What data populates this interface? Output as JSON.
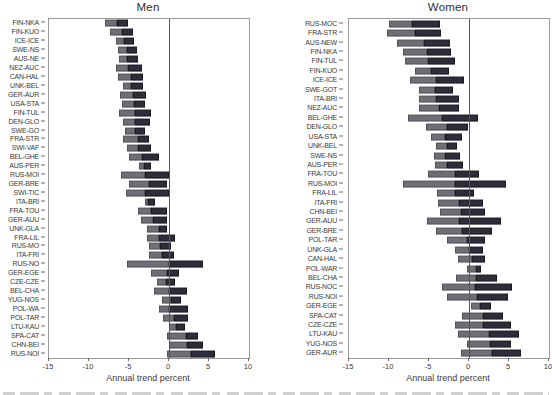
{
  "figure": {
    "kind": "two-panel horizontal stacked bar chart",
    "colors": {
      "gray_segment": "#6e6e74",
      "dark_segment": "#2e2e3a",
      "zero_line": "#55555a",
      "frame": "#9b9b9b",
      "text": "#3b3b3b"
    }
  },
  "chart_data": [
    {
      "type": "bar",
      "orientation": "horizontal",
      "title": "Men",
      "xlabel": "Annual trend percent",
      "xlim": [
        -15,
        10
      ],
      "xticks": [
        -15,
        -10,
        -5,
        0,
        5,
        10
      ],
      "grid": false,
      "legend": false,
      "zero_reference_line": 0,
      "segment_colors": {
        "gray": "#6e6e74",
        "dark": "#2e2e3a"
      },
      "rows": [
        {
          "label": "FIN-NKA",
          "gray": [
            -8.0,
            -6.5
          ],
          "dark": [
            -6.5,
            -5.1
          ]
        },
        {
          "label": "FIN-KUO",
          "gray": [
            -7.4,
            -5.9
          ],
          "dark": [
            -5.9,
            -4.5
          ]
        },
        {
          "label": "ICE-ICE",
          "gray": [
            -6.6,
            -5.6
          ],
          "dark": [
            -5.6,
            -4.4
          ]
        },
        {
          "label": "SWE-NS",
          "gray": [
            -6.4,
            -5.2
          ],
          "dark": [
            -5.2,
            -4.0
          ]
        },
        {
          "label": "AUS-NE",
          "gray": [
            -6.3,
            -5.2
          ],
          "dark": [
            -5.2,
            -3.9
          ]
        },
        {
          "label": "NEZ-AUC",
          "gray": [
            -6.6,
            -5.1
          ],
          "dark": [
            -5.1,
            -3.4
          ]
        },
        {
          "label": "CAN-HAL",
          "gray": [
            -6.4,
            -4.8
          ],
          "dark": [
            -4.8,
            -3.2
          ]
        },
        {
          "label": "UNK-BEL",
          "gray": [
            -5.7,
            -4.7
          ],
          "dark": [
            -4.7,
            -3.3
          ]
        },
        {
          "label": "GER-AUR",
          "gray": [
            -6.1,
            -4.5
          ],
          "dark": [
            -4.5,
            -2.9
          ]
        },
        {
          "label": "USA-STA",
          "gray": [
            -5.9,
            -4.4
          ],
          "dark": [
            -4.4,
            -3.0
          ]
        },
        {
          "label": "FIN-TUL",
          "gray": [
            -6.2,
            -4.3
          ],
          "dark": [
            -4.3,
            -2.2
          ]
        },
        {
          "label": "DEN-GLO",
          "gray": [
            -5.8,
            -4.2
          ],
          "dark": [
            -4.2,
            -2.4
          ]
        },
        {
          "label": "SWE-GO",
          "gray": [
            -5.5,
            -4.2
          ],
          "dark": [
            -4.2,
            -3.0
          ]
        },
        {
          "label": "FRA-STR",
          "gray": [
            -5.8,
            -3.9
          ],
          "dark": [
            -3.9,
            -2.5
          ]
        },
        {
          "label": "SWI-VAF",
          "gray": [
            -5.2,
            -3.9
          ],
          "dark": [
            -3.9,
            -2.3
          ]
        },
        {
          "label": "BEL-GHE",
          "gray": [
            -5.0,
            -3.4
          ],
          "dark": [
            -3.4,
            -1.2
          ]
        },
        {
          "label": "AUS-PER",
          "gray": [
            -3.7,
            -3.1
          ],
          "dark": [
            -3.1,
            -2.3
          ]
        },
        {
          "label": "RUS-MOI",
          "gray": [
            -6.0,
            -3.0
          ],
          "dark": [
            -3.0,
            0.0
          ]
        },
        {
          "label": "GER-BRE",
          "gray": [
            -5.0,
            -2.5
          ],
          "dark": [
            -2.5,
            -0.3
          ]
        },
        {
          "label": "SWI-TIC",
          "gray": [
            -5.4,
            -3.0
          ],
          "dark": [
            -3.0,
            0.0
          ]
        },
        {
          "label": "ITA-BRI",
          "gray": [
            -3.0,
            -2.6
          ],
          "dark": [
            -2.6,
            -1.7
          ]
        },
        {
          "label": "FRA-TOU",
          "gray": [
            -3.9,
            -2.3
          ],
          "dark": [
            -2.3,
            -0.3
          ]
        },
        {
          "label": "GER-AUU",
          "gray": [
            -3.5,
            -2.0
          ],
          "dark": [
            -2.0,
            -0.2
          ]
        },
        {
          "label": "UNK-GLA",
          "gray": [
            -2.7,
            -1.2
          ],
          "dark": [
            -1.2,
            -0.2
          ]
        },
        {
          "label": "FRA-LIL",
          "gray": [
            -2.8,
            -1.3
          ],
          "dark": [
            -1.3,
            0.8
          ]
        },
        {
          "label": "RUS-MO",
          "gray": [
            -2.5,
            -1.1
          ],
          "dark": [
            -1.1,
            0.3
          ]
        },
        {
          "label": "ITA-FRI",
          "gray": [
            -2.5,
            -0.9
          ],
          "dark": [
            -0.9,
            0.6
          ]
        },
        {
          "label": "RUS-NO",
          "gray": [
            -5.3,
            0.0
          ],
          "dark": [
            0.0,
            4.2
          ]
        },
        {
          "label": "GER-EGE",
          "gray": [
            -2.3,
            -0.3
          ],
          "dark": [
            -0.3,
            1.3
          ]
        },
        {
          "label": "CZE-CZE",
          "gray": [
            -1.5,
            -0.4
          ],
          "dark": [
            -0.4,
            0.8
          ]
        },
        {
          "label": "BEL-CHA",
          "gray": [
            -1.9,
            0.0
          ],
          "dark": [
            0.0,
            2.3
          ]
        },
        {
          "label": "YUG-NOS",
          "gray": [
            -0.9,
            0.3
          ],
          "dark": [
            0.3,
            1.5
          ]
        },
        {
          "label": "POL-WA",
          "gray": [
            -1.3,
            0.0
          ],
          "dark": [
            0.0,
            2.4
          ]
        },
        {
          "label": "POL-TAR",
          "gray": [
            -0.7,
            0.6
          ],
          "dark": [
            0.6,
            2.4
          ]
        },
        {
          "label": "LTU-KAU",
          "gray": [
            0.0,
            0.9
          ],
          "dark": [
            0.9,
            2.0
          ]
        },
        {
          "label": "SPA-CAT",
          "gray": [
            -0.2,
            2.1
          ],
          "dark": [
            2.1,
            3.6
          ]
        },
        {
          "label": "CHN-BEI",
          "gray": [
            0.0,
            2.3
          ],
          "dark": [
            2.3,
            4.2
          ]
        },
        {
          "label": "RUS-NOI",
          "gray": [
            -0.2,
            2.8
          ],
          "dark": [
            2.8,
            5.8
          ]
        }
      ]
    },
    {
      "type": "bar",
      "orientation": "horizontal",
      "title": "Women",
      "xlabel": "Annual trend percent",
      "xlim": [
        -15,
        10
      ],
      "xticks": [
        -15,
        -10,
        -5,
        0,
        5,
        10
      ],
      "grid": false,
      "legend": false,
      "zero_reference_line": 0,
      "segment_colors": {
        "gray": "#6e6e74",
        "dark": "#2e2e3a"
      },
      "rows": [
        {
          "label": "RUS-MOC",
          "gray": [
            -10.0,
            -7.1
          ],
          "dark": [
            -7.1,
            -3.6
          ]
        },
        {
          "label": "FRA-STR",
          "gray": [
            -10.3,
            -6.7
          ],
          "dark": [
            -6.7,
            -3.5
          ]
        },
        {
          "label": "AUS-NEW",
          "gray": [
            -9.0,
            -5.6
          ],
          "dark": [
            -5.6,
            -2.4
          ]
        },
        {
          "label": "FIN-NKA",
          "gray": [
            -8.3,
            -5.3
          ],
          "dark": [
            -5.3,
            -2.3
          ]
        },
        {
          "label": "FIN-TUL",
          "gray": [
            -8.0,
            -5.1
          ],
          "dark": [
            -5.1,
            -1.8
          ]
        },
        {
          "label": "FIN-KUO",
          "gray": [
            -6.7,
            -4.7
          ],
          "dark": [
            -4.7,
            -2.5
          ]
        },
        {
          "label": "ICE-ICE",
          "gray": [
            -7.4,
            -4.1
          ],
          "dark": [
            -4.1,
            -0.6
          ]
        },
        {
          "label": "SWE-GOT",
          "gray": [
            -6.2,
            -4.3
          ],
          "dark": [
            -4.3,
            -2.0
          ]
        },
        {
          "label": "ITA-BRI",
          "gray": [
            -6.2,
            -4.1
          ],
          "dark": [
            -4.1,
            -1.3
          ]
        },
        {
          "label": "NEZ-AUC",
          "gray": [
            -6.3,
            -3.8
          ],
          "dark": [
            -3.8,
            -1.3
          ]
        },
        {
          "label": "BEL-GHE",
          "gray": [
            -7.6,
            -3.4
          ],
          "dark": [
            -3.4,
            1.1
          ]
        },
        {
          "label": "DEN-GLO",
          "gray": [
            -5.4,
            -2.8
          ],
          "dark": [
            -2.8,
            -0.1
          ]
        },
        {
          "label": "USA-STA",
          "gray": [
            -4.7,
            -3.0
          ],
          "dark": [
            -3.0,
            -0.9
          ]
        },
        {
          "label": "UNK-BEL",
          "gray": [
            -4.1,
            -2.8
          ],
          "dark": [
            -2.8,
            -1.5
          ]
        },
        {
          "label": "SWE-NS",
          "gray": [
            -4.4,
            -3.0
          ],
          "dark": [
            -3.0,
            -1.1
          ]
        },
        {
          "label": "AUS-PER",
          "gray": [
            -4.3,
            -2.7
          ],
          "dark": [
            -2.7,
            -0.8
          ]
        },
        {
          "label": "FRA-TOU",
          "gray": [
            -5.1,
            -1.8
          ],
          "dark": [
            -1.8,
            1.2
          ]
        },
        {
          "label": "RUS-MOI",
          "gray": [
            -8.3,
            -1.8
          ],
          "dark": [
            -1.8,
            4.6
          ]
        },
        {
          "label": "FRA-LIL",
          "gray": [
            -4.0,
            -1.7
          ],
          "dark": [
            -1.7,
            0.6
          ]
        },
        {
          "label": "ITA-FRI",
          "gray": [
            -3.9,
            -1.3
          ],
          "dark": [
            -1.3,
            1.8
          ]
        },
        {
          "label": "CHN-BEI",
          "gray": [
            -3.6,
            -1.0
          ],
          "dark": [
            -1.0,
            2.0
          ]
        },
        {
          "label": "GER-AUU",
          "gray": [
            -5.3,
            -1.3
          ],
          "dark": [
            -1.3,
            4.0
          ]
        },
        {
          "label": "GER-BRE",
          "gray": [
            -4.1,
            -0.9
          ],
          "dark": [
            -0.9,
            2.9
          ]
        },
        {
          "label": "POL-TAR",
          "gray": [
            -2.8,
            -0.3
          ],
          "dark": [
            -0.3,
            2.0
          ]
        },
        {
          "label": "UNK-GLA",
          "gray": [
            -1.7,
            0.0
          ],
          "dark": [
            0.0,
            1.8
          ]
        },
        {
          "label": "CAN-HAL",
          "gray": [
            -1.4,
            0.4
          ],
          "dark": [
            0.4,
            2.0
          ]
        },
        {
          "label": "POL-WAR",
          "gray": [
            -0.3,
            0.9
          ],
          "dark": [
            0.9,
            1.5
          ]
        },
        {
          "label": "BEL-CHA",
          "gray": [
            -1.6,
            0.9
          ],
          "dark": [
            0.9,
            3.5
          ]
        },
        {
          "label": "RUS-NOC",
          "gray": [
            -3.4,
            0.8
          ],
          "dark": [
            0.8,
            5.4
          ]
        },
        {
          "label": "RUS-NOI",
          "gray": [
            -2.7,
            1.0
          ],
          "dark": [
            1.0,
            4.9
          ]
        },
        {
          "label": "GER-EGE",
          "gray": [
            0.3,
            1.4
          ],
          "dark": [
            1.4,
            2.7
          ]
        },
        {
          "label": "SPA-CAT",
          "gray": [
            -0.9,
            1.8
          ],
          "dark": [
            1.8,
            4.3
          ]
        },
        {
          "label": "CZE-CZE",
          "gray": [
            -1.7,
            1.8
          ],
          "dark": [
            1.8,
            5.2
          ]
        },
        {
          "label": "LTU-KAU",
          "gray": [
            -1.4,
            2.5
          ],
          "dark": [
            2.5,
            6.3
          ]
        },
        {
          "label": "YUG-NOS",
          "gray": [
            -0.3,
            2.6
          ],
          "dark": [
            2.6,
            5.2
          ]
        },
        {
          "label": "GER-AUR",
          "gray": [
            -1.0,
            2.9
          ],
          "dark": [
            2.9,
            6.5
          ]
        }
      ]
    }
  ]
}
